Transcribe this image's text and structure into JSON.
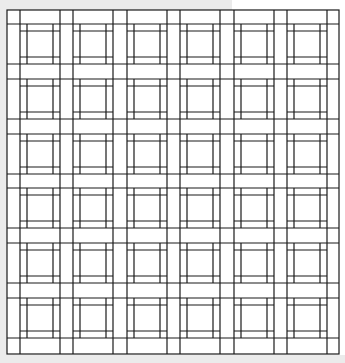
{
  "diagram": {
    "title": "",
    "colors": {
      "line": "#1a1a1a",
      "fill": "#ffffff",
      "background": "#ebebeb"
    },
    "frame": {
      "x": 7,
      "y": 10,
      "width": 332,
      "height": 344
    },
    "columns": 6,
    "rows": 6,
    "cell_x": [
      20,
      73,
      127,
      180,
      234,
      287
    ],
    "cell_y": [
      24,
      79,
      134,
      188,
      243,
      298
    ],
    "cell_size": 40,
    "inner_inset": 7,
    "line_width": 1.2
  }
}
